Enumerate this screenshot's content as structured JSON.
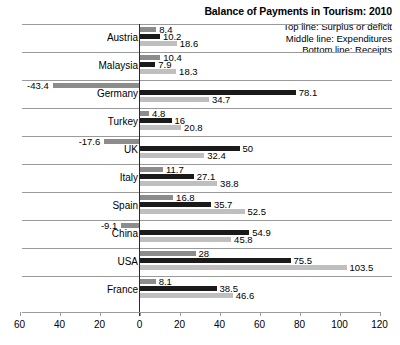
{
  "chart_data": {
    "type": "bar",
    "title": "Balance of Payments in Tourism: 2010",
    "xlabel": "",
    "ylabel": "",
    "xlim": [
      -60,
      120
    ],
    "xticks": [
      -60,
      -40,
      -20,
      0,
      20,
      40,
      60,
      80,
      100,
      120
    ],
    "xtick_labels": [
      "60",
      "40",
      "20",
      "0",
      "20",
      "40",
      "60",
      "80",
      "100",
      "120"
    ],
    "grid": false,
    "orientation": "horizontal",
    "legend_position": "top-right",
    "categories": [
      "Austria",
      "Malaysia",
      "Germany",
      "Turkey",
      "UK",
      "Italy",
      "Spain",
      "China",
      "USA",
      "France"
    ],
    "series": [
      {
        "name": "Surplus or deficit",
        "color": "#8c8c8c",
        "values": [
          8.4,
          10.4,
          -43.4,
          4.8,
          -17.6,
          11.7,
          16.8,
          -9.1,
          28,
          8.1
        ]
      },
      {
        "name": "Expenditures",
        "color": "#1a1a1a",
        "values": [
          10.2,
          7.9,
          78.1,
          16,
          50,
          27.1,
          35.7,
          54.9,
          75.5,
          38.5
        ]
      },
      {
        "name": "Receipts",
        "color": "#bfbfbf",
        "values": [
          18.6,
          18.3,
          34.7,
          20.8,
          32.4,
          38.8,
          52.5,
          45.8,
          103.5,
          46.6
        ]
      }
    ],
    "value_labels": {
      "Austria": {
        "surplus": "8.4",
        "expenditures": "10.2",
        "receipts": "18.6"
      },
      "Malaysia": {
        "surplus": "10.4",
        "expenditures": "7.9",
        "receipts": "18.3"
      },
      "Germany": {
        "surplus": "-43.4",
        "expenditures": "78.1",
        "receipts": "34.7"
      },
      "Turkey": {
        "surplus": "4.8",
        "expenditures": "16",
        "receipts": "20.8"
      },
      "UK": {
        "surplus": "-17.6",
        "expenditures": "50",
        "receipts": "32.4"
      },
      "Italy": {
        "surplus": "11.7",
        "expenditures": "27.1",
        "receipts": "38.8"
      },
      "Spain": {
        "surplus": "16.8",
        "expenditures": "35.7",
        "receipts": "52.5"
      },
      "China": {
        "surplus": "-9.1",
        "expenditures": "54.9",
        "receipts": "45.8"
      },
      "USA": {
        "surplus": "28",
        "expenditures": "75.5",
        "receipts": "103.5"
      },
      "France": {
        "surplus": "8.1",
        "expenditures": "38.5",
        "receipts": "46.6"
      }
    }
  },
  "legend": {
    "line1": "Top line: Surplus or deficit",
    "line2": "Middle line: Expenditures",
    "line3": "Bottom line: Receipts"
  }
}
